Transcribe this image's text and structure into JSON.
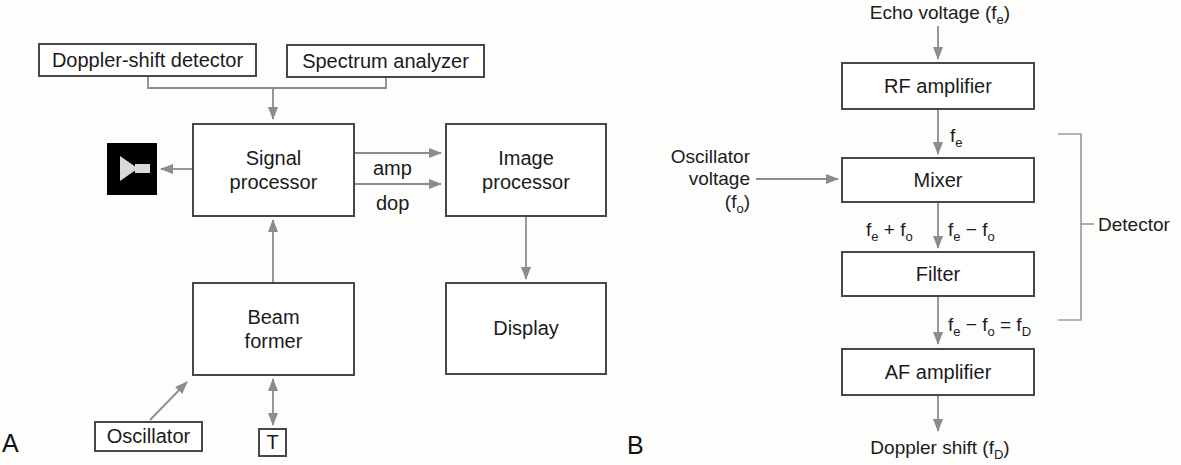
{
  "panel_a": {
    "label": "A",
    "boxes": {
      "doppler_shift_detector": "Doppler-shift detector",
      "spectrum_analyzer": "Spectrum analyzer",
      "signal_processor": "Signal processor",
      "image_processor": "Image processor",
      "beam_former": "Beam former",
      "display": "Display",
      "oscillator": "Oscillator",
      "transducer": "T"
    },
    "arrow_labels": {
      "amp": "amp",
      "dop": "dop"
    },
    "speaker_icon": "loudspeaker-icon"
  },
  "panel_b": {
    "label": "B",
    "boxes": {
      "rf_amplifier": "RF amplifier",
      "mixer": "Mixer",
      "filter": "Filter",
      "af_amplifier": "AF amplifier"
    },
    "bracket_label": "Detector",
    "formulas": {
      "echo_voltage": [
        {
          "t": "Echo voltage (f"
        },
        {
          "t": "e",
          "sub": true
        },
        {
          "t": ")"
        }
      ],
      "fe": [
        {
          "t": "f"
        },
        {
          "t": "e",
          "sub": true
        }
      ],
      "oscillator_voltage_line1": "Oscillator",
      "oscillator_voltage_line2": "voltage",
      "oscillator_voltage_line3": [
        {
          "t": "(f"
        },
        {
          "t": "o",
          "sub": true
        },
        {
          "t": ")"
        }
      ],
      "fe_plus_fo": [
        {
          "t": "f"
        },
        {
          "t": "e",
          "sub": true
        },
        {
          "t": " + f"
        },
        {
          "t": "o",
          "sub": true
        }
      ],
      "fe_minus_fo": [
        {
          "t": "f"
        },
        {
          "t": "e",
          "sub": true
        },
        {
          "t": " − f"
        },
        {
          "t": "o",
          "sub": true
        }
      ],
      "fe_minus_fo_eq_fd": [
        {
          "t": "f"
        },
        {
          "t": "e",
          "sub": true
        },
        {
          "t": " − f"
        },
        {
          "t": "o",
          "sub": true
        },
        {
          "t": " = f"
        },
        {
          "t": "D",
          "sub": true
        }
      ],
      "doppler_shift": [
        {
          "t": "Doppler shift (f"
        },
        {
          "t": "D",
          "sub": true
        },
        {
          "t": ")"
        }
      ]
    }
  },
  "colors": {
    "line_gray": "#8c8c8c",
    "bracket_gray": "#9d9d9d",
    "box_border": "#474747",
    "text": "#1b1b1b",
    "speaker_background": "#000000",
    "speaker_glyph": "#d9d9d9"
  }
}
